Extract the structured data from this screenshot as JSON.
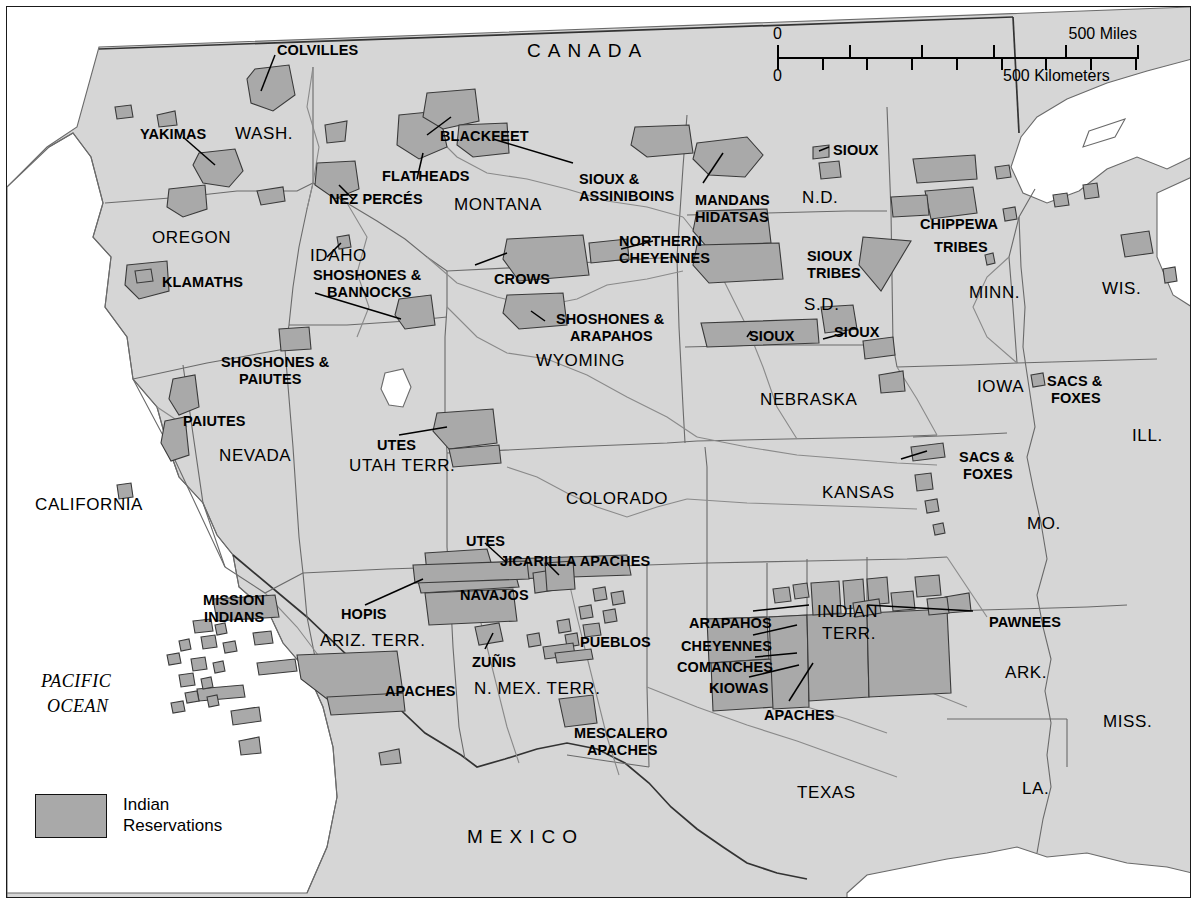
{
  "map": {
    "title": "Indian Reservations of the Western United States",
    "background_land": "#d6d6d6",
    "reservation_fill": "#a9a9a9",
    "water_fill": "#ffffff",
    "border_color": "#1a1a1a",
    "line_color": "#555555"
  },
  "legend": {
    "swatch_color": "#a9a9a9",
    "label": "Indian\nReservations"
  },
  "scale": {
    "miles_zero": "0",
    "miles_max": "500 Miles",
    "km_zero": "0",
    "km_max": "500 Kilometers",
    "miles_ticks": [
      0,
      100,
      200,
      300,
      400,
      500
    ],
    "km_ticks": [
      0,
      100,
      200,
      300,
      400,
      500,
      600,
      700,
      800
    ]
  },
  "countries": [
    {
      "name": "CANADA",
      "x": 520,
      "y": 34
    },
    {
      "name": "MEXICO",
      "x": 460,
      "y": 820
    }
  ],
  "oceans": [
    {
      "name": "PACIFIC",
      "x": 34,
      "y": 665
    },
    {
      "name": "OCEAN",
      "x": 40,
      "y": 690
    }
  ],
  "states": [
    {
      "name": "WASH.",
      "x": 228,
      "y": 118
    },
    {
      "name": "OREGON",
      "x": 145,
      "y": 222
    },
    {
      "name": "IDAHO",
      "x": 303,
      "y": 240
    },
    {
      "name": "MONTANA",
      "x": 447,
      "y": 189
    },
    {
      "name": "N.D.",
      "x": 795,
      "y": 182
    },
    {
      "name": "MINN.",
      "x": 962,
      "y": 277
    },
    {
      "name": "WIS.",
      "x": 1095,
      "y": 273
    },
    {
      "name": "S.D.",
      "x": 797,
      "y": 289
    },
    {
      "name": "WYOMING",
      "x": 529,
      "y": 345
    },
    {
      "name": "NEBRASKA",
      "x": 753,
      "y": 384
    },
    {
      "name": "IOWA",
      "x": 970,
      "y": 371
    },
    {
      "name": "ILL.",
      "x": 1125,
      "y": 420
    },
    {
      "name": "NEVADA",
      "x": 212,
      "y": 440
    },
    {
      "name": "UTAH TERR.",
      "x": 342,
      "y": 450
    },
    {
      "name": "COLORADO",
      "x": 559,
      "y": 483
    },
    {
      "name": "KANSAS",
      "x": 815,
      "y": 477
    },
    {
      "name": "MO.",
      "x": 1020,
      "y": 508
    },
    {
      "name": "CALIFORNIA",
      "x": 28,
      "y": 489
    },
    {
      "name": "ARIZ. TERR.",
      "x": 313,
      "y": 625
    },
    {
      "name": "N. MEX. TERR.",
      "x": 467,
      "y": 673
    },
    {
      "name": "ARK.",
      "x": 998,
      "y": 657
    },
    {
      "name": "MISS.",
      "x": 1096,
      "y": 706
    },
    {
      "name": "LA.",
      "x": 1015,
      "y": 773
    },
    {
      "name": "TEXAS",
      "x": 790,
      "y": 777
    }
  ],
  "indian_territory": [
    {
      "name": "INDIAN",
      "x": 810,
      "y": 596
    },
    {
      "name": "TERR.",
      "x": 815,
      "y": 618
    }
  ],
  "tribes": [
    {
      "name": "COLVILLES",
      "x": 270,
      "y": 36
    },
    {
      "name": "YAKIMAS",
      "x": 133,
      "y": 120
    },
    {
      "name": "BLACKFEET",
      "x": 433,
      "y": 122
    },
    {
      "name": "FLATHEADS",
      "x": 375,
      "y": 162
    },
    {
      "name": "NEZ PERCÉS",
      "x": 322,
      "y": 185
    },
    {
      "name": "SIOUX & ",
      "x": 572,
      "y": 165
    },
    {
      "name": "ASSINIBOINS",
      "x": 572,
      "y": 182
    },
    {
      "name": "MANDANS",
      "x": 688,
      "y": 186
    },
    {
      "name": "HIDATSAS",
      "x": 688,
      "y": 203
    },
    {
      "name": "SIOUX",
      "x": 826,
      "y": 136
    },
    {
      "name": "CHIPPEWA",
      "x": 913,
      "y": 210
    },
    {
      "name": "TRIBES",
      "x": 927,
      "y": 233
    },
    {
      "name": "NORTHERN",
      "x": 612,
      "y": 227
    },
    {
      "name": "CHEYENNES",
      "x": 612,
      "y": 244
    },
    {
      "name": "SIOUX",
      "x": 800,
      "y": 242
    },
    {
      "name": "TRIBES",
      "x": 800,
      "y": 259
    },
    {
      "name": "CROWS",
      "x": 487,
      "y": 265
    },
    {
      "name": "KLAMATHS",
      "x": 155,
      "y": 268
    },
    {
      "name": "SHOSHONES &",
      "x": 306,
      "y": 261
    },
    {
      "name": "BANNOCKS",
      "x": 320,
      "y": 278
    },
    {
      "name": "SHOSHONES &",
      "x": 549,
      "y": 305
    },
    {
      "name": "ARAPAHOS",
      "x": 563,
      "y": 322
    },
    {
      "name": "SIOUX",
      "x": 742,
      "y": 322
    },
    {
      "name": "SIOUX",
      "x": 827,
      "y": 318
    },
    {
      "name": "SHOSHONES &",
      "x": 214,
      "y": 348
    },
    {
      "name": "PAIUTES",
      "x": 232,
      "y": 365
    },
    {
      "name": "SACS &",
      "x": 1040,
      "y": 367
    },
    {
      "name": "FOXES",
      "x": 1044,
      "y": 384
    },
    {
      "name": "PAIUTES",
      "x": 176,
      "y": 407
    },
    {
      "name": "UTES",
      "x": 370,
      "y": 431
    },
    {
      "name": "SACS &",
      "x": 952,
      "y": 443
    },
    {
      "name": "FOXES",
      "x": 956,
      "y": 460
    },
    {
      "name": "UTES",
      "x": 459,
      "y": 527
    },
    {
      "name": "JICARILLA APACHES",
      "x": 493,
      "y": 547
    },
    {
      "name": "MISSION",
      "x": 196,
      "y": 586
    },
    {
      "name": "INDIANS",
      "x": 197,
      "y": 603
    },
    {
      "name": "NAVAJOS",
      "x": 453,
      "y": 581
    },
    {
      "name": "HOPIS",
      "x": 334,
      "y": 600
    },
    {
      "name": "PAWNEES",
      "x": 982,
      "y": 608
    },
    {
      "name": "ARAPAHOS",
      "x": 682,
      "y": 609
    },
    {
      "name": "CHEYENNES",
      "x": 674,
      "y": 632
    },
    {
      "name": "PUEBLOS",
      "x": 573,
      "y": 628
    },
    {
      "name": "ZUÑIS",
      "x": 465,
      "y": 648
    },
    {
      "name": "COMANCHES",
      "x": 670,
      "y": 653
    },
    {
      "name": "APACHES",
      "x": 378,
      "y": 677
    },
    {
      "name": "KIOWAS",
      "x": 702,
      "y": 674
    },
    {
      "name": "APACHES",
      "x": 757,
      "y": 701
    },
    {
      "name": "MESCALERO",
      "x": 567,
      "y": 719
    },
    {
      "name": "APACHES",
      "x": 580,
      "y": 736
    }
  ]
}
